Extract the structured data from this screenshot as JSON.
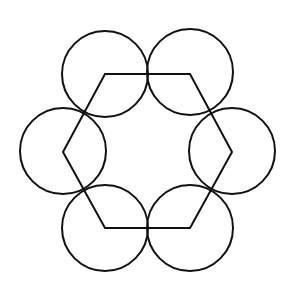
{
  "canvas": {
    "width": 287,
    "height": 283,
    "background": "#ffffff",
    "stroke_color": "#111111",
    "stroke_width": 2
  },
  "hexagon": {
    "vertices": [
      [
        105,
        74
      ],
      [
        190,
        74
      ],
      [
        232,
        152
      ],
      [
        190,
        228
      ],
      [
        105,
        228
      ],
      [
        63,
        152
      ]
    ]
  },
  "circles": [
    {
      "name": "top-left",
      "cx": 105,
      "cy": 74,
      "r": 43
    },
    {
      "name": "top-right",
      "cx": 190,
      "cy": 72,
      "r": 43
    },
    {
      "name": "left",
      "cx": 63,
      "cy": 151,
      "r": 43
    },
    {
      "name": "right",
      "cx": 232,
      "cy": 151,
      "r": 43
    },
    {
      "name": "bottom-left",
      "cx": 105,
      "cy": 228,
      "r": 43
    },
    {
      "name": "bottom-right",
      "cx": 190,
      "cy": 228,
      "r": 43
    }
  ]
}
